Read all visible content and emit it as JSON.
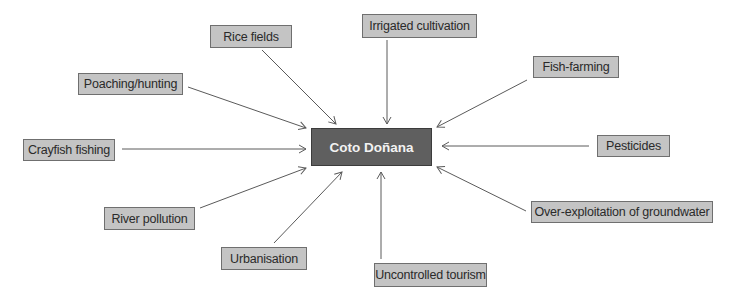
{
  "center": {
    "label": "Coto Doñana",
    "fill": "#5f5f5f",
    "text_color": "#f2f2f2"
  },
  "node_style": {
    "fill": "#c4c4c4",
    "border": "#6f6f6f",
    "arrow_color": "#5a5a5a"
  },
  "nodes": [
    {
      "id": "rice-fields",
      "label": "Rice fields",
      "box": [
        210,
        25,
        82,
        23
      ],
      "arrow": [
        262,
        50,
        336,
        124
      ]
    },
    {
      "id": "irrigated-cultivation",
      "label": "Irrigated cultivation",
      "box": [
        362,
        14,
        115,
        24
      ],
      "arrow": [
        387,
        40,
        387,
        124
      ]
    },
    {
      "id": "fish-farming",
      "label": "Fish-farming",
      "box": [
        533,
        56,
        86,
        22
      ],
      "arrow": [
        527,
        80,
        437,
        127
      ]
    },
    {
      "id": "poaching-hunting",
      "label": "Poaching/hunting",
      "box": [
        78,
        73,
        105,
        22
      ],
      "arrow": [
        188,
        87,
        306,
        128
      ]
    },
    {
      "id": "crayfish-fishing",
      "label": "Crayfish fishing",
      "box": [
        23,
        139,
        92,
        22
      ],
      "arrow": [
        122,
        149,
        306,
        149
      ]
    },
    {
      "id": "pesticides",
      "label": "Pesticides",
      "box": [
        597,
        135,
        73,
        22
      ],
      "arrow": [
        589,
        146,
        442,
        146
      ]
    },
    {
      "id": "river-pollution",
      "label": "River pollution",
      "box": [
        104,
        207,
        91,
        23
      ],
      "arrow": [
        200,
        208,
        306,
        168
      ]
    },
    {
      "id": "over-exploitation-groundwater",
      "label": "Over-exploitation of groundwater",
      "box": [
        531,
        201,
        182,
        22
      ],
      "arrow": [
        526,
        211,
        437,
        167
      ]
    },
    {
      "id": "urbanisation",
      "label": "Urbanisation",
      "box": [
        221,
        247,
        86,
        23
      ],
      "arrow": [
        274,
        243,
        342,
        172
      ]
    },
    {
      "id": "uncontrolled-tourism",
      "label": "Uncontrolled tourism",
      "box": [
        374,
        263,
        113,
        24
      ],
      "arrow": [
        381,
        259,
        381,
        172
      ]
    }
  ],
  "center_box": [
    311,
    128,
    121,
    38
  ]
}
